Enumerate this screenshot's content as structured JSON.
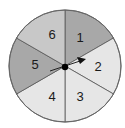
{
  "spinner": {
    "center": [
      65,
      66
    ],
    "radius": 56,
    "sectors": [
      {
        "label": "1",
        "start_deg": 90,
        "end_deg": 30,
        "color": "#a8a8a8"
      },
      {
        "label": "2",
        "start_deg": 30,
        "end_deg": -30,
        "color": "#e6e6e6"
      },
      {
        "label": "3",
        "start_deg": -30,
        "end_deg": -90,
        "color": "#e6e6e6"
      },
      {
        "label": "4",
        "start_deg": -90,
        "end_deg": -150,
        "color": "#e6e6e6"
      },
      {
        "label": "5",
        "start_deg": -150,
        "end_deg": -210,
        "color": "#a8a8a8"
      },
      {
        "label": "6",
        "start_deg": 150,
        "end_deg": 90,
        "color": "#c8c8c8"
      }
    ],
    "arrow": {
      "points_to": "2"
    }
  }
}
